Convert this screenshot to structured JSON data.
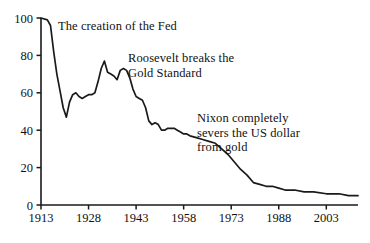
{
  "chart_data": {
    "type": "line",
    "title": "",
    "subtitle": "",
    "xlabel": "",
    "ylabel": "",
    "xlim": [
      1913,
      2013
    ],
    "ylim": [
      0,
      100
    ],
    "grid": false,
    "legend": "none",
    "line_color": "#1a1a1a",
    "background_color": "#ffffff",
    "x_ticks": [
      "1913",
      "1928",
      "1943",
      "1958",
      "1973",
      "1988",
      "2003"
    ],
    "x_tick_values": [
      1913,
      1928,
      1943,
      1958,
      1973,
      1988,
      2003
    ],
    "y_ticks": [
      "0",
      "20",
      "40",
      "60",
      "80",
      "100"
    ],
    "y_tick_values": [
      0,
      20,
      40,
      60,
      80,
      100
    ],
    "series": [
      {
        "name": "Purchasing power of the US dollar",
        "x": [
          1913,
          1915,
          1916,
          1917,
          1918,
          1919,
          1920,
          1921,
          1922,
          1923,
          1924,
          1925,
          1926,
          1927,
          1928,
          1929,
          1930,
          1931,
          1932,
          1933,
          1934,
          1935,
          1936,
          1937,
          1938,
          1939,
          1940,
          1941,
          1942,
          1943,
          1944,
          1945,
          1946,
          1947,
          1948,
          1949,
          1950,
          1951,
          1952,
          1953,
          1954,
          1955,
          1956,
          1957,
          1958,
          1959,
          1960,
          1962,
          1964,
          1966,
          1968,
          1970,
          1972,
          1974,
          1976,
          1978,
          1980,
          1982,
          1984,
          1986,
          1988,
          1990,
          1993,
          1996,
          1999,
          2003,
          2007,
          2010,
          2013
        ],
        "y": [
          100,
          99,
          96,
          82,
          70,
          61,
          52,
          47,
          55,
          59,
          60,
          58,
          57,
          58,
          59,
          59,
          60,
          66,
          73,
          77,
          71,
          70,
          69,
          67,
          72,
          73,
          72,
          68,
          62,
          58,
          57,
          56,
          52,
          45,
          43,
          44,
          43,
          40,
          40,
          41,
          41,
          41,
          40,
          39,
          38,
          38,
          37,
          36,
          35,
          34,
          33,
          30,
          27,
          23,
          19,
          16,
          12,
          11,
          10,
          10,
          9,
          8,
          8,
          7,
          7,
          6,
          6,
          5,
          5
        ]
      }
    ],
    "annotations": [
      {
        "id": "fed",
        "lines": [
          "The creation of the Fed"
        ],
        "near_year": 1913,
        "near_value": 100
      },
      {
        "id": "roosevelt",
        "lines": [
          "Roosevelt breaks the",
          "Gold Standard"
        ],
        "near_year": 1933,
        "near_value": 77
      },
      {
        "id": "nixon",
        "lines": [
          "Nixon completely",
          "severs the US dollar",
          "from gold"
        ],
        "near_year": 1971,
        "near_value": 29
      }
    ]
  }
}
